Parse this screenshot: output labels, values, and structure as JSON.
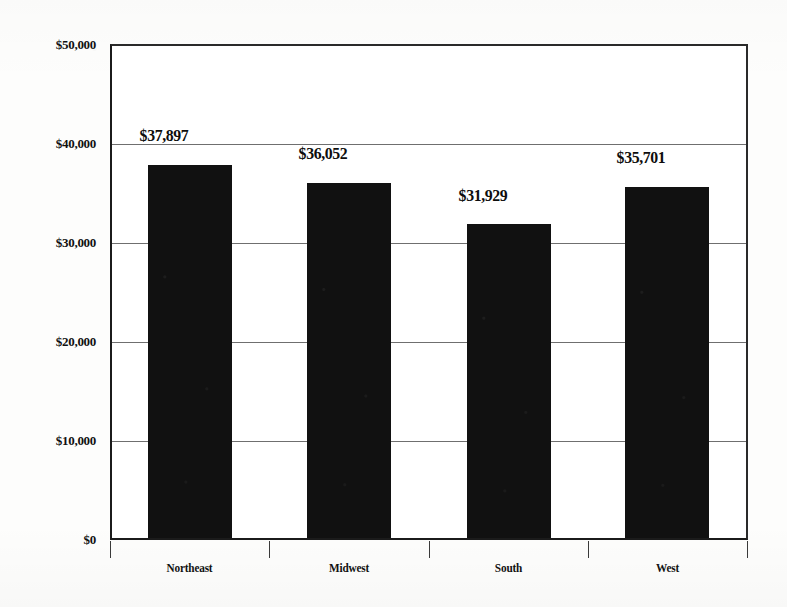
{
  "chart_data": {
    "type": "bar",
    "title": "",
    "xlabel": "",
    "ylabel": "",
    "categories": [
      "Northeast",
      "Midwest",
      "South",
      "West"
    ],
    "values": [
      37897,
      36052,
      31929,
      35701
    ],
    "data_labels": [
      "$37,897",
      "$36,052",
      "$31,929",
      "$35,701"
    ],
    "ylim": [
      0,
      50000
    ],
    "ytick_values": [
      50000,
      40000,
      30000,
      20000,
      10000,
      0
    ],
    "ytick_labels": [
      "$50,000",
      "$40,000",
      "$30,000",
      "$20,000",
      "$10,000",
      "$0"
    ],
    "grid": true,
    "legend": false,
    "bar_color": "#111111",
    "axis_color": "#1b1b1b",
    "grid_color": "#6f6f6f",
    "background_color": "#ffffff"
  }
}
